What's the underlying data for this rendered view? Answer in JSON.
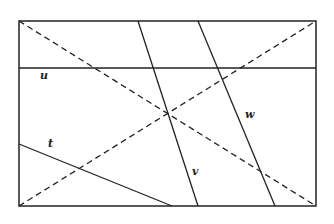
{
  "diagram": {
    "colors": {
      "stroke": "#222222",
      "background": "#ffffff"
    },
    "frame": {
      "x": 19,
      "y": 21,
      "width": 297,
      "height": 185
    },
    "solid_lines": [
      {
        "id": "u",
        "x1": 19,
        "y1": 68,
        "x2": 316,
        "y2": 68
      },
      {
        "id": "v",
        "x1": 138,
        "y1": 21,
        "x2": 198,
        "y2": 206
      },
      {
        "id": "w",
        "x1": 198,
        "y1": 21,
        "x2": 275,
        "y2": 206
      },
      {
        "id": "t",
        "x1": 19,
        "y1": 144,
        "x2": 172,
        "y2": 206
      }
    ],
    "dashed_lines": [
      {
        "id": "diag1",
        "x1": 19,
        "y1": 21,
        "x2": 316,
        "y2": 206
      },
      {
        "id": "diag2",
        "x1": 19,
        "y1": 206,
        "x2": 316,
        "y2": 21
      }
    ],
    "labels": {
      "u": "u",
      "v": "v",
      "w": "w",
      "t": "t"
    }
  }
}
